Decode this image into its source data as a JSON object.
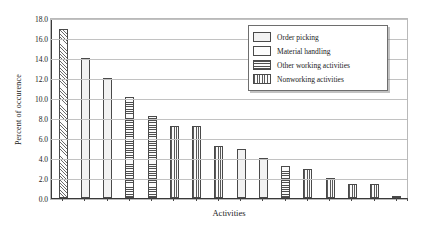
{
  "chart_data": {
    "type": "bar",
    "title": "",
    "xlabel": "Activities",
    "ylabel": "Percent of occurence",
    "ylim": [
      0.0,
      18.0
    ],
    "ytick_labels": [
      "18.0",
      "16.0",
      "14.0",
      "12.0",
      "10.0",
      "8.0",
      "6.0",
      "4.0",
      "2.0",
      "0.0"
    ],
    "ytick_values": [
      18.0,
      16.0,
      14.0,
      12.0,
      10.0,
      8.0,
      6.0,
      4.0,
      2.0,
      0.0
    ],
    "grid": true,
    "legend_position": "top-right",
    "categories": [
      "1",
      "2",
      "3",
      "4",
      "5",
      "6",
      "7",
      "8",
      "9",
      "10",
      "11",
      "12",
      "13",
      "14",
      "15",
      "16"
    ],
    "values": [
      16.9,
      14.0,
      12.0,
      10.1,
      8.2,
      7.2,
      7.2,
      5.2,
      4.9,
      4.0,
      3.2,
      2.9,
      2.0,
      1.4,
      1.4,
      0.2
    ],
    "bar_categories": [
      "Order picking",
      "Order picking",
      "Material handling",
      "Other working activities",
      "Other working activities",
      "Nonworking activities",
      "Nonworking activities",
      "Order picking",
      "Order picking",
      "Material handling",
      "Other working activities",
      "Nonworking activities",
      "Nonworking activities",
      "Nonworking activities",
      "Nonworking activities",
      "Nonworking activities"
    ],
    "bar_patterns": [
      "diagonal",
      "dots",
      "dots",
      "horizontal",
      "horizontal",
      "vertical",
      "vertical",
      "vertical",
      "dots",
      "dots",
      "horizontal",
      "vertical",
      "vertical",
      "vertical",
      "vertical",
      "vertical"
    ],
    "legend": [
      {
        "label": "Order picking",
        "pattern": "dots"
      },
      {
        "label": "Material handling",
        "pattern": "fine-grid"
      },
      {
        "label": "Other working activities",
        "pattern": "horizontal"
      },
      {
        "label": "Nonworking activities",
        "pattern": "vertical"
      }
    ]
  },
  "colors": {
    "background": "#ffffff",
    "gridline": "#c2c2c2",
    "axis": "#3a3a3a",
    "bar_outline": "#4a4a4a",
    "text": "#1a1a1a",
    "legend_border": "#6e6e6e"
  }
}
